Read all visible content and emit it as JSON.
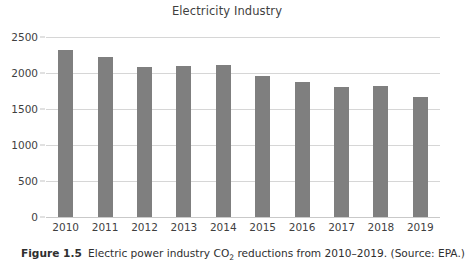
{
  "chart_data": {
    "type": "bar",
    "title": "Electricity Industry",
    "xlabel": "",
    "ylabel": "",
    "categories": [
      "2010",
      "2011",
      "2012",
      "2013",
      "2014",
      "2015",
      "2016",
      "2017",
      "2018",
      "2019"
    ],
    "values": [
      2320,
      2220,
      2080,
      2100,
      2105,
      1960,
      1880,
      1800,
      1815,
      1670
    ],
    "ylim": [
      0,
      2500
    ],
    "ytick_labels": [
      "0",
      "500",
      "1000",
      "1500",
      "2000",
      "2500"
    ],
    "ytick_values": [
      0,
      500,
      1000,
      1500,
      2000,
      2500
    ],
    "grid": true,
    "legend": "none",
    "series": [
      {
        "name": "Electric power industry CO2 emissions",
        "values": [
          2320,
          2220,
          2080,
          2100,
          2105,
          1960,
          1880,
          1800,
          1815,
          1670
        ]
      }
    ],
    "colors": {
      "bar": "#7f7f7f",
      "gridline": "#d6d6d6",
      "text": "#3f3f3f",
      "background": "#ffffff"
    }
  },
  "caption": {
    "label": "Figure 1.5",
    "text_before_sub": "Electric power industry CO",
    "subscript": "2",
    "text_after_sub": " reductions from 2010–2019. (Source: EPA.)"
  }
}
